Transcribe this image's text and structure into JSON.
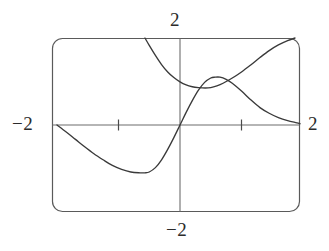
{
  "figure": {
    "title": "",
    "frame": {
      "x": 52,
      "y": 38,
      "width": 248,
      "height": 174,
      "corner_radius": 10,
      "stroke": "#5a5a5a"
    },
    "origin": {
      "x": 180,
      "y": 125
    },
    "unit_px": {
      "x": 61.5,
      "y": 43.5
    }
  },
  "labels": {
    "y_max": "2",
    "y_min": "−2",
    "x_min": "−2",
    "x_max": "2"
  },
  "colors": {
    "frame": "#5a5a5a",
    "axis": "#6d6d6d",
    "curve": "#3a3a3a",
    "background": "#ffffff",
    "text": "#2b2b2b"
  },
  "chart_data": {
    "type": "line",
    "title": "",
    "xlabel": "",
    "ylabel": "",
    "xlim": [
      -2,
      2
    ],
    "ylim": [
      -2,
      2
    ],
    "grid": false,
    "legend": "none",
    "xticks": [
      -1,
      1
    ],
    "yticks": [],
    "xtick_labels": [
      "-2",
      "2"
    ],
    "ytick_labels": [
      "-2",
      "2"
    ],
    "axis_corner_labels": {
      "left": "-2",
      "right": "2",
      "top": "2",
      "bottom": "-2"
    },
    "series": [
      {
        "name": "sine-like-curve",
        "type": "line",
        "color": "#3a3a3a",
        "description": "S-shaped oscillating curve passing through the origin; enters at left edge on the x-axis, falls to a minimum near (-0.57, -1.10), rises through the origin to a maximum near (0.57, 1.10), then falls toward the x-axis at the right edge",
        "points": [
          [
            -2.0,
            0.0
          ],
          [
            -1.85,
            -0.16
          ],
          [
            -1.7,
            -0.33
          ],
          [
            -1.55,
            -0.5
          ],
          [
            -1.4,
            -0.66
          ],
          [
            -1.25,
            -0.8
          ],
          [
            -1.1,
            -0.93
          ],
          [
            -0.95,
            -1.02
          ],
          [
            -0.8,
            -1.08
          ],
          [
            -0.65,
            -1.1
          ],
          [
            -0.57,
            -1.1
          ],
          [
            -0.5,
            -1.08
          ],
          [
            -0.4,
            -0.98
          ],
          [
            -0.3,
            -0.8
          ],
          [
            -0.2,
            -0.56
          ],
          [
            -0.1,
            -0.29
          ],
          [
            0.0,
            0.0
          ],
          [
            0.1,
            0.29
          ],
          [
            0.2,
            0.56
          ],
          [
            0.3,
            0.8
          ],
          [
            0.4,
            0.98
          ],
          [
            0.5,
            1.08
          ],
          [
            0.57,
            1.1
          ],
          [
            0.65,
            1.1
          ],
          [
            0.75,
            1.05
          ],
          [
            0.85,
            0.96
          ],
          [
            1.0,
            0.78
          ],
          [
            1.15,
            0.58
          ],
          [
            1.3,
            0.4
          ],
          [
            1.45,
            0.27
          ],
          [
            1.6,
            0.17
          ],
          [
            1.75,
            0.1
          ],
          [
            1.9,
            0.05
          ],
          [
            2.0,
            0.03
          ]
        ]
      },
      {
        "name": "u-shaped-curve",
        "type": "line",
        "color": "#3a3a3a",
        "description": "Upward-opening U curve entering at the top edge near x = -0.55, reaching a minimum near (0.41, 0.85), then rising steeply to exit the top edge near x = 1.87",
        "points": [
          [
            -0.57,
            2.0
          ],
          [
            -0.5,
            1.83
          ],
          [
            -0.4,
            1.6
          ],
          [
            -0.3,
            1.39
          ],
          [
            -0.2,
            1.22
          ],
          [
            -0.1,
            1.09
          ],
          [
            0.0,
            0.99
          ],
          [
            0.1,
            0.92
          ],
          [
            0.2,
            0.88
          ],
          [
            0.3,
            0.86
          ],
          [
            0.41,
            0.85
          ],
          [
            0.5,
            0.86
          ],
          [
            0.6,
            0.9
          ],
          [
            0.7,
            0.96
          ],
          [
            0.85,
            1.08
          ],
          [
            1.0,
            1.22
          ],
          [
            1.15,
            1.38
          ],
          [
            1.3,
            1.55
          ],
          [
            1.45,
            1.71
          ],
          [
            1.6,
            1.84
          ],
          [
            1.75,
            1.94
          ],
          [
            1.87,
            2.0
          ]
        ]
      }
    ]
  }
}
